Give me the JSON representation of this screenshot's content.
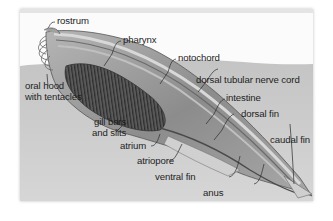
{
  "diagram": {
    "labels": {
      "rostrum": "rostrum",
      "pharynx": "pharynx",
      "notochord": "notochord",
      "oral_hood_line1": "oral hood",
      "oral_hood_line2": "with tentacles",
      "dorsal_nerve_cord": "dorsal tubular nerve cord",
      "intestine": "intestine",
      "dorsal_fin": "dorsal fin",
      "gill_line1": "gill bars",
      "gill_line2": "and slits",
      "atrium": "atrium",
      "atriopore": "atriopore",
      "caudal_fin": "caudal fin",
      "ventral_fin": "ventral fin",
      "anus": "anus"
    },
    "colors": {
      "background": "#ffffff",
      "sediment": "#c9c9c9",
      "body": "#9a9a9a",
      "pharynx": "#4a4a4a",
      "text": "#1e1e1e"
    }
  }
}
